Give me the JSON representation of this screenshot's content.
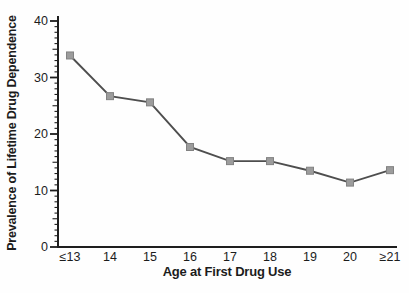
{
  "chart_data": {
    "type": "line",
    "title": "",
    "xlabel": "Age at First Drug Use",
    "ylabel": "Prevalence of Lifetime Drug Dependence",
    "categories": [
      "≤13",
      "14",
      "15",
      "16",
      "17",
      "18",
      "19",
      "20",
      "≥21"
    ],
    "values": [
      33.9,
      26.7,
      25.6,
      17.7,
      15.2,
      15.2,
      13.5,
      11.4,
      13.6
    ],
    "ylim": [
      0,
      40
    ],
    "yticks_major": [
      0,
      10,
      20,
      30,
      40
    ],
    "ytick_minor_step": 1,
    "ytick_medium_step": 5,
    "grid": false,
    "legend": false,
    "marker_shape": "square",
    "colors": {
      "line": "#4e4e4e",
      "marker_fill": "#9c9c9c",
      "marker_stroke": "#828282",
      "axis": "#1e1e1e",
      "text": "#1c1c1c",
      "background": "#fefefe"
    }
  }
}
